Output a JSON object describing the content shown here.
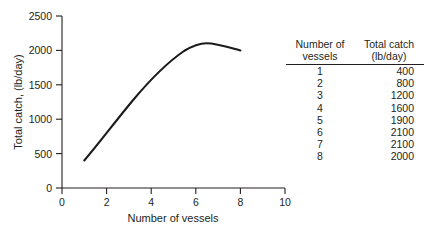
{
  "chart_data": {
    "type": "line",
    "title": "",
    "xlabel": "Number of vessels",
    "ylabel": "Total catch, (lb/day)",
    "xlim": [
      0,
      10
    ],
    "ylim": [
      0,
      2500
    ],
    "xticks": [
      0,
      2,
      4,
      6,
      8,
      10
    ],
    "yticks": [
      0,
      500,
      1000,
      1500,
      2000,
      2500
    ],
    "xtick_labels": [
      "0",
      "2",
      "4",
      "6",
      "8",
      "10"
    ],
    "ytick_labels": [
      "0",
      "500",
      "1000",
      "1500",
      "2000",
      "2500"
    ],
    "grid": false,
    "legend": false,
    "series": [
      {
        "name": "Total catch",
        "x": [
          1,
          2,
          3,
          4,
          5,
          6,
          7,
          8
        ],
        "values": [
          400,
          800,
          1200,
          1600,
          1900,
          2100,
          2100,
          2000
        ],
        "color": "#1a1a1a",
        "peak_x": 6.5,
        "peak_y": 2130
      }
    ]
  },
  "chart": {
    "ylabel": "Total catch, (lb/day)",
    "xlabel": "Number of vessels",
    "ytick_labels": [
      "2500",
      "2000",
      "1500",
      "1000",
      "500",
      "0"
    ],
    "xtick_labels": [
      "0",
      "2",
      "4",
      "6",
      "8",
      "10"
    ]
  },
  "table": {
    "headers": [
      {
        "line1": "Number of",
        "line2": "vessels"
      },
      {
        "line1": "Total catch",
        "line2": "(lb/day)"
      }
    ],
    "rows": [
      {
        "vessels": "1",
        "catch": "400"
      },
      {
        "vessels": "2",
        "catch": "800"
      },
      {
        "vessels": "3",
        "catch": "1200"
      },
      {
        "vessels": "4",
        "catch": "1600"
      },
      {
        "vessels": "5",
        "catch": "1900"
      },
      {
        "vessels": "6",
        "catch": "2100"
      },
      {
        "vessels": "7",
        "catch": "2100"
      },
      {
        "vessels": "8",
        "catch": "2000"
      }
    ]
  },
  "colors": {
    "axis": "#231f20",
    "curve": "#1a1a1a",
    "background": "#ffffff"
  }
}
